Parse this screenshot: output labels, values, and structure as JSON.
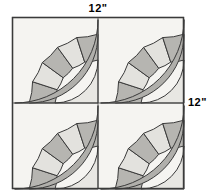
{
  "diagram": {
    "shape": "square",
    "grid": {
      "rows": 2,
      "cols": 2,
      "total_quadrants": 4
    },
    "labels": {
      "top": "12\"",
      "right": "12\""
    },
    "square": {
      "x": 12,
      "y": 17,
      "size": 172,
      "stroke": "#3a3a3a",
      "fill": "#f5f4f1"
    },
    "quadrant": {
      "size": 86,
      "arc_origin": "bottom-right",
      "description": "quarter fan / New York Beauty block",
      "rings": [
        {
          "name": "inner-disc",
          "r_outer": 0.5,
          "fill": "#e8e7e3"
        },
        {
          "name": "wedge-ring",
          "r_inner": 0.5,
          "r_outer": 0.8,
          "wedges": 5
        },
        {
          "name": "outer-band",
          "r_inner": 0.8,
          "r_outer": 0.97,
          "fill": "#b0afab"
        }
      ],
      "wedge_fills": [
        "#b6b5b1",
        "#e3e2de",
        "#b6b5b1",
        "#e3e2de",
        "#b6b5b1"
      ],
      "wedge_angles_deg": [
        0,
        18,
        36,
        54,
        72,
        90
      ]
    },
    "colors": {
      "background": "#ffffff",
      "block_background": "#f5f4f1",
      "light_patch": "#e3e2de",
      "inner_patch": "#e8e7e3",
      "dark_patch": "#b6b5b1",
      "outer_band": "#b0afab",
      "stroke": "#3a3a3a",
      "label_text": "#000000"
    }
  }
}
